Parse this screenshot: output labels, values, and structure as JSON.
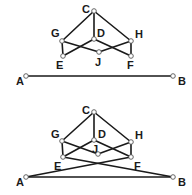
{
  "diagrams": [
    {
      "id": "top",
      "nodes": {
        "C": {
          "x": 94,
          "y": 11,
          "label": "C",
          "lx": 82,
          "ly": 13
        },
        "G": {
          "x": 62,
          "y": 41,
          "label": "G",
          "lx": 51,
          "ly": 37
        },
        "D": {
          "x": 94,
          "y": 39,
          "label": "D",
          "lx": 97,
          "ly": 37
        },
        "H": {
          "x": 131,
          "y": 41,
          "label": "H",
          "lx": 135,
          "ly": 38
        },
        "E": {
          "x": 63,
          "y": 56,
          "label": "E",
          "lx": 56,
          "ly": 69
        },
        "J": {
          "x": 99,
          "y": 52,
          "label": "J",
          "lx": 95,
          "ly": 66
        },
        "F": {
          "x": 131,
          "y": 56,
          "label": "F",
          "lx": 127,
          "ly": 69
        },
        "A": {
          "x": 26,
          "y": 76,
          "label": "A",
          "lx": 16,
          "ly": 85
        },
        "B": {
          "x": 173,
          "y": 76,
          "label": "B",
          "lx": 178,
          "ly": 85
        }
      },
      "edges": [
        [
          "C",
          "G"
        ],
        [
          "C",
          "D"
        ],
        [
          "C",
          "H"
        ],
        [
          "G",
          "E"
        ],
        [
          "H",
          "F"
        ],
        [
          "G",
          "J"
        ],
        [
          "J",
          "H"
        ],
        [
          "D",
          "E"
        ],
        [
          "D",
          "F"
        ],
        [
          "A",
          "B"
        ]
      ]
    },
    {
      "id": "bottom",
      "nodes": {
        "C": {
          "x": 94,
          "y": 112,
          "label": "C",
          "lx": 82,
          "ly": 114
        },
        "G": {
          "x": 62,
          "y": 141,
          "label": "G",
          "lx": 51,
          "ly": 138
        },
        "D": {
          "x": 94,
          "y": 140,
          "label": "D",
          "lx": 98,
          "ly": 138
        },
        "H": {
          "x": 131,
          "y": 142,
          "label": "H",
          "lx": 135,
          "ly": 139
        },
        "E": {
          "x": 63,
          "y": 157,
          "label": "E",
          "lx": 54,
          "ly": 170
        },
        "J": {
          "x": 98,
          "y": 154,
          "label": "J",
          "lx": 92,
          "ly": 153
        },
        "F": {
          "x": 131,
          "y": 157,
          "label": "F",
          "lx": 134,
          "ly": 170
        },
        "A": {
          "x": 26,
          "y": 177,
          "label": "A",
          "lx": 16,
          "ly": 186
        },
        "B": {
          "x": 173,
          "y": 177,
          "label": "B",
          "lx": 178,
          "ly": 186
        }
      },
      "edges": [
        [
          "C",
          "G"
        ],
        [
          "C",
          "D"
        ],
        [
          "C",
          "H"
        ],
        [
          "G",
          "E"
        ],
        [
          "H",
          "F"
        ],
        [
          "G",
          "J"
        ],
        [
          "J",
          "H"
        ],
        [
          "D",
          "E"
        ],
        [
          "D",
          "F"
        ],
        [
          "A",
          "B"
        ],
        [
          "E",
          "B"
        ],
        [
          "F",
          "A"
        ]
      ]
    }
  ],
  "colors": {
    "edge": "#1a1a1a",
    "node_fill": "#ffffff",
    "node_stroke": "#555555",
    "label": "#1a1a1a"
  }
}
